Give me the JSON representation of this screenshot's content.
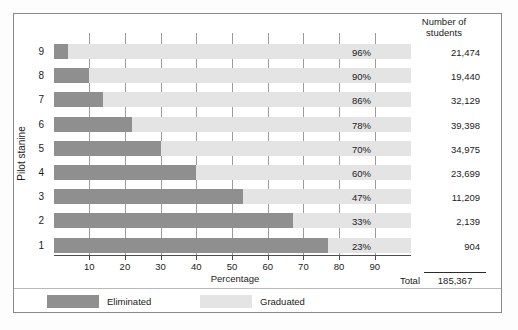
{
  "chart_data": {
    "type": "bar",
    "orientation": "horizontal",
    "stacked": true,
    "title": "",
    "xlabel": "Percentage",
    "ylabel": "Pilot stanine",
    "xlim": [
      0,
      100
    ],
    "xticks": [
      10,
      20,
      30,
      40,
      50,
      60,
      70,
      80,
      90
    ],
    "grid": true,
    "legend_position": "bottom",
    "categories": [
      "9",
      "8",
      "7",
      "6",
      "5",
      "4",
      "3",
      "2",
      "1"
    ],
    "series": [
      {
        "name": "Eliminated",
        "color": "#8f8f8f",
        "values": [
          4,
          10,
          14,
          22,
          30,
          40,
          53,
          67,
          77
        ]
      },
      {
        "name": "Graduated",
        "color": "#e4e4e4",
        "values": [
          96,
          90,
          86,
          78,
          70,
          60,
          47,
          33,
          23
        ]
      }
    ],
    "rows": [
      {
        "stanine": "9",
        "eliminated": 4,
        "graduated": 96,
        "graduated_label": "96%",
        "students": "21,474"
      },
      {
        "stanine": "8",
        "eliminated": 10,
        "graduated": 90,
        "graduated_label": "90%",
        "students": "19,440"
      },
      {
        "stanine": "7",
        "eliminated": 14,
        "graduated": 86,
        "graduated_label": "86%",
        "students": "32,129"
      },
      {
        "stanine": "6",
        "eliminated": 22,
        "graduated": 78,
        "graduated_label": "78%",
        "students": "39,398"
      },
      {
        "stanine": "5",
        "eliminated": 30,
        "graduated": 70,
        "graduated_label": "70%",
        "students": "34,975"
      },
      {
        "stanine": "4",
        "eliminated": 40,
        "graduated": 60,
        "graduated_label": "60%",
        "students": "23,699"
      },
      {
        "stanine": "3",
        "eliminated": 53,
        "graduated": 47,
        "graduated_label": "47%",
        "students": "11,209"
      },
      {
        "stanine": "2",
        "eliminated": 67,
        "graduated": 33,
        "graduated_label": "33%",
        "students": "2,139"
      },
      {
        "stanine": "1",
        "eliminated": 77,
        "graduated": 23,
        "graduated_label": "23%",
        "students": "904"
      }
    ],
    "column_header": "Number of\nstudents",
    "total_label": "Total",
    "total_value": "185,367"
  },
  "axis": {
    "x_title": "Percentage",
    "y_title": "Pilot stanine",
    "tick_labels": [
      "10",
      "20",
      "30",
      "40",
      "50",
      "60",
      "70",
      "80",
      "90"
    ]
  },
  "table": {
    "header_line1": "Number of",
    "header_line2": "students",
    "total_label": "Total",
    "total_value": "185,367"
  },
  "legend": {
    "items": [
      {
        "label": "Eliminated",
        "color": "#8f8f8f"
      },
      {
        "label": "Graduated",
        "color": "#e4e4e4"
      }
    ]
  }
}
